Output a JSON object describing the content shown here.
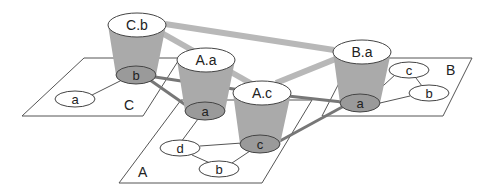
{
  "diagram": {
    "planes": [
      {
        "id": "C",
        "label": "C"
      },
      {
        "id": "A",
        "label": "A"
      },
      {
        "id": "B",
        "label": "B"
      }
    ],
    "plane_nodes": [
      {
        "id": "C-a",
        "plane": "C",
        "label": "a"
      },
      {
        "id": "A-d",
        "plane": "A",
        "label": "d"
      },
      {
        "id": "A-b",
        "plane": "A",
        "label": "b"
      },
      {
        "id": "B-c",
        "plane": "B",
        "label": "c"
      },
      {
        "id": "B-b",
        "plane": "B",
        "label": "b"
      }
    ],
    "cylinders": [
      {
        "id": "Cb",
        "top_label": "C.b",
        "bottom_label": "b",
        "plane": "C"
      },
      {
        "id": "Aa",
        "top_label": "A.a",
        "bottom_label": "a",
        "plane": "A"
      },
      {
        "id": "Ac",
        "top_label": "A.c",
        "bottom_label": "c",
        "plane": "A"
      },
      {
        "id": "Ba",
        "top_label": "B.a",
        "bottom_label": "a",
        "plane": "B"
      }
    ],
    "intra_edges": [
      [
        "C-a",
        "Cb.bottom"
      ],
      [
        "Aa.bottom",
        "A-d"
      ],
      [
        "A-d",
        "Ac.bottom"
      ],
      [
        "A-d",
        "A-b"
      ],
      [
        "A-b",
        "Ac.bottom"
      ],
      [
        "Ba.bottom",
        "B-c"
      ],
      [
        "B-c",
        "B-b"
      ],
      [
        "Ba.bottom",
        "B-b"
      ]
    ],
    "inter_edges": [
      [
        "Cb.bottom",
        "Aa.bottom"
      ],
      [
        "Cb.bottom",
        "Ac.top"
      ],
      [
        "Ac.top",
        "Ba.bottom"
      ],
      [
        "Ac.bottom",
        "Ba.bottom"
      ]
    ],
    "top_edges": [
      [
        "Cb.top",
        "Ba.top"
      ],
      [
        "Cb.top",
        "Ac.top"
      ],
      [
        "Ac.top",
        "Ba.top"
      ]
    ],
    "colors": {
      "cylinder_body": "#aaaaaa",
      "cylinder_bottom": "#9a9a9a",
      "top_edge": "#b8b8b8",
      "inter_edge": "#777777"
    }
  }
}
